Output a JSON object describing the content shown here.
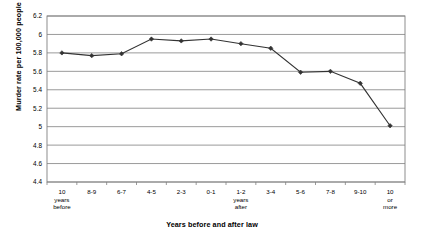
{
  "chart_data": {
    "type": "line",
    "title": "",
    "xlabel": "Years before and after law",
    "ylabel": "Murder rate per 100,000 people",
    "categories": [
      "10 years before",
      "8-9",
      "6-7",
      "4-5",
      "2-3",
      "0-1",
      "1-2 years after",
      "3-4",
      "5-6",
      "7-8",
      "9-10",
      "10 or more"
    ],
    "category_lines": [
      [
        "10",
        "years",
        "before"
      ],
      [
        "8-9"
      ],
      [
        "6-7"
      ],
      [
        "4-5"
      ],
      [
        "2-3"
      ],
      [
        "0-1"
      ],
      [
        "1-2",
        "years",
        "after"
      ],
      [
        "3-4"
      ],
      [
        "5-6"
      ],
      [
        "7-8"
      ],
      [
        "9-10"
      ],
      [
        "10",
        "or",
        "more"
      ]
    ],
    "values": [
      5.8,
      5.77,
      5.79,
      5.95,
      5.93,
      5.95,
      5.9,
      5.85,
      5.59,
      5.6,
      5.47,
      5.01
    ],
    "ylim": [
      4.4,
      6.2
    ],
    "yticks": [
      6.2,
      6,
      5.8,
      5.6,
      5.4,
      5.2,
      5,
      4.8,
      4.6,
      4.4
    ],
    "ytick_labels": [
      "6.2",
      "6",
      "5.8",
      "5.6",
      "5.4",
      "5.2",
      "5",
      "4.8",
      "4.6",
      "4.4"
    ],
    "grid": true,
    "legend": "none",
    "series_color": "#333333",
    "marker": "diamond",
    "gridline_color": "#808080",
    "background": "#ffffff"
  }
}
